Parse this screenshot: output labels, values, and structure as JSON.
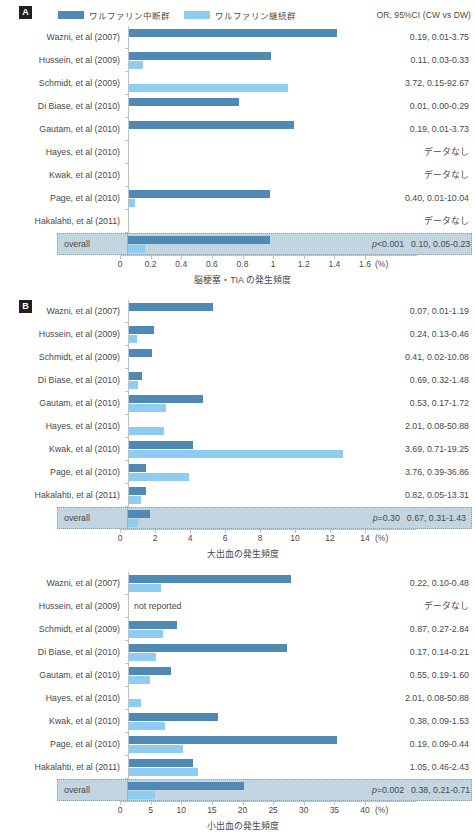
{
  "legend": {
    "series": [
      {
        "key": "dw",
        "label": "ワルファリン中断群",
        "color": "#5089b3"
      },
      {
        "key": "cw",
        "label": "ワルファリン継続群",
        "color": "#8fcdf0"
      }
    ],
    "or_header": "OR, 95%CI (CW vs DW)"
  },
  "panel_tags": {
    "a": "A",
    "b": "B"
  },
  "labels": {
    "overall": "overall",
    "no_data": "データなし",
    "not_reported": "not reported",
    "percent_unit": "(%)"
  },
  "chart_data": [
    {
      "id": "panel-a",
      "type": "bar",
      "title": "脳梗塞・TIA の発生頻度",
      "xlabel": "脳梗塞・TIA の発生頻度",
      "ylabel": "",
      "unit": "(%)",
      "xlim": [
        0,
        1.6
      ],
      "ticks": [
        0,
        0.2,
        0.4,
        0.6,
        0.8,
        1,
        1.2,
        1.4,
        1.6
      ],
      "tick_labels": [
        "0",
        "0.2",
        "0.4",
        "0.6",
        "0.8",
        "1",
        "1.2",
        "1.4",
        "1.6"
      ],
      "grid": false,
      "legend_position": "top",
      "categories": [
        "Wazni, et al (2007)",
        "Hussein, et al (2009)",
        "Schmidt, et al (2009)",
        "Di Biase, et al (2010)",
        "Gautam, et al (2010)",
        "Hayes, et al (2010)",
        "Kwak, et al (2010)",
        "Page, et al (2010)",
        "Hakalahti, et al (2011)"
      ],
      "series": [
        {
          "name": "ワルファリン中断群",
          "key": "dw",
          "values": [
            1.36,
            0.93,
            0.0,
            0.72,
            1.08,
            null,
            null,
            0.92,
            null
          ]
        },
        {
          "name": "ワルファリン継続群",
          "key": "cw",
          "values": [
            0.0,
            0.09,
            1.04,
            0.0,
            0.0,
            null,
            null,
            0.04,
            null
          ]
        }
      ],
      "or_values": [
        "0.19, 0.01-3.75",
        "0.11, 0.03-0.33",
        "3.72, 0.15-92.67",
        "0.01, 0.00-0.29",
        "0.19, 0.01-3.73",
        "データなし",
        "データなし",
        "0.40, 0.01-10.04",
        "データなし"
      ],
      "overall": {
        "label": "overall",
        "dw": 0.93,
        "cw": 0.11,
        "pvalue": "p<0.001",
        "pvalue_prefix": "p",
        "pvalue_rest": "<0.001",
        "or": "0.10, 0.05-0.23"
      }
    },
    {
      "id": "panel-b",
      "type": "bar",
      "title": "大出血の発生頻度",
      "xlabel": "大出血の発生頻度",
      "ylabel": "",
      "unit": "(%)",
      "xlim": [
        0,
        14
      ],
      "ticks": [
        0,
        2,
        4,
        6,
        8,
        10,
        12,
        14
      ],
      "tick_labels": [
        "0",
        "2",
        "4",
        "6",
        "8",
        "10",
        "12",
        "14"
      ],
      "grid": false,
      "legend_position": "none",
      "categories": [
        "Wazni, et al (2007)",
        "Hussein, et al (2009)",
        "Schmidt, et al (2009)",
        "Di Biase, et al (2010)",
        "Gautam, et al (2010)",
        "Hayes, et al (2010)",
        "Kwak, et al (2010)",
        "Page, et al (2010)",
        "Hakalahti, et al (2011)"
      ],
      "series": [
        {
          "name": "ワルファリン中断群",
          "key": "dw",
          "values": [
            4.8,
            1.4,
            1.3,
            0.72,
            4.2,
            0.0,
            3.65,
            0.95,
            0.95
          ]
        },
        {
          "name": "ワルファリン継続群",
          "key": "cw",
          "values": [
            0.0,
            0.45,
            0.0,
            0.5,
            2.1,
            2.0,
            12.2,
            3.4,
            0.7
          ]
        }
      ],
      "or_values": [
        "0.07, 0.01-1.19",
        "0.24, 0.13-0.46",
        "0.41, 0.02-10.08",
        "0.69, 0.32-1.48",
        "0.53, 0.17-1.72",
        "2.01, 0.08-50.88",
        "3.69, 0.71-19.25",
        "3.76, 0.39-36.86",
        "0.82, 0.05-13.31"
      ],
      "overall": {
        "label": "overall",
        "dw": 1.25,
        "cw": 0.55,
        "pvalue": "p=0.30",
        "pvalue_prefix": "p",
        "pvalue_rest": "=0.30",
        "or": "0.67, 0.31-1.43"
      }
    },
    {
      "id": "panel-c",
      "type": "bar",
      "title": "小出血の発生頻度",
      "xlabel": "小出血の発生頻度",
      "ylabel": "",
      "unit": "(%)",
      "xlim": [
        0,
        40
      ],
      "ticks": [
        0,
        5,
        10,
        15,
        20,
        25,
        30,
        35,
        40
      ],
      "tick_labels": [
        "0",
        "5",
        "10",
        "15",
        "20",
        "25",
        "30",
        "35",
        "40"
      ],
      "grid": false,
      "legend_position": "none",
      "categories": [
        "Wazni, et al (2007)",
        "Hussein, et al (2009)",
        "Schmidt, et al (2009)",
        "Di Biase, et al (2010)",
        "Gautam, et al (2010)",
        "Hayes, et al (2010)",
        "Kwak, et al (2010)",
        "Page, et al (2010)",
        "Hakalahti, et al (2011)"
      ],
      "series": [
        {
          "name": "ワルファリン中断群",
          "key": "dw",
          "values": [
            26.5,
            null,
            7.8,
            25.8,
            6.8,
            0.0,
            14.5,
            34.0,
            10.5
          ]
        },
        {
          "name": "ワルファリン継続群",
          "key": "cw",
          "values": [
            5.2,
            null,
            5.6,
            4.4,
            3.5,
            2.0,
            5.8,
            8.8,
            11.2
          ]
        }
      ],
      "or_values": [
        "0.22, 0.10-0.48",
        "データなし",
        "0.87, 0.27-2.84",
        "0.17, 0.14-0.21",
        "0.55, 0.19-1.60",
        "2.01, 0.08-50.88",
        "0.38, 0.09-1.53",
        "0.19, 0.09-0.44",
        "1.05, 0.46-2.43"
      ],
      "not_reported_rows": [
        1
      ],
      "overall": {
        "label": "overall",
        "dw": 19.0,
        "cw": 4.4,
        "pvalue": "p=0.002",
        "pvalue_prefix": "p",
        "pvalue_rest": "=0.002",
        "or": "0.38, 0.21-0.71"
      }
    }
  ]
}
